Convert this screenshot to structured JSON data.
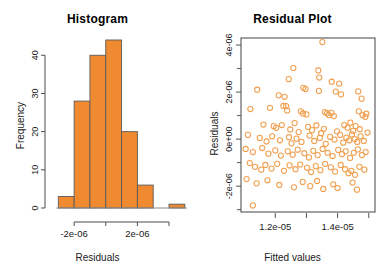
{
  "figure": {
    "background": "#ffffff",
    "panels": [
      "Histogram",
      "Residual Plot"
    ]
  },
  "colors": {
    "bar_fill": "#F08A30",
    "bar_border": "#5a5a5a",
    "point_stroke": "#F0A050",
    "axis": "#4d4d4d",
    "text": "#1a1a1a"
  },
  "histogram": {
    "title": "Histogram",
    "xlabel": "Residuals",
    "ylabel": "Frequency",
    "x_tick_labels": [
      "-2e-06",
      "2e-06"
    ],
    "y_tick_labels": [
      "0",
      "10",
      "20",
      "30",
      "40"
    ]
  },
  "residual": {
    "title": "Residual Plot",
    "xlabel": "Fitted values",
    "ylabel": "Residuals",
    "x_tick_labels": [
      "1.2e-05",
      "1.4e-05"
    ],
    "y_tick_labels": [
      "4e-06",
      "2e-06",
      "0e+00",
      "-2e-06"
    ]
  },
  "chart_data": [
    {
      "type": "bar",
      "title": "Histogram",
      "xlabel": "Residuals",
      "ylabel": "Frequency",
      "grid": false,
      "legend": "none",
      "bin_edges": [
        -3e-06,
        -2e-06,
        -1e-06,
        0,
        1e-06,
        2e-06,
        3e-06,
        4e-06,
        5e-06
      ],
      "categories": [
        "-3e-06..-2e-06",
        "-2e-06..-1e-06",
        "-1e-06..0",
        "0..1e-06",
        "1e-06..2e-06",
        "2e-06..3e-06",
        "4e-06..5e-06"
      ],
      "values": [
        3,
        28,
        40,
        44,
        20,
        6,
        1
      ],
      "xlim": [
        -3.4e-06,
        5.2e-06
      ],
      "ylim": [
        0,
        44
      ],
      "x_ticks": [
        -2e-06,
        0,
        2e-06,
        4e-06
      ],
      "x_ticks_labeled": [
        -2e-06,
        2e-06
      ],
      "y_ticks": [
        0,
        10,
        20,
        30,
        40
      ],
      "note": "Seventh bar is detached with a gap from the main group (outlier bin)."
    },
    {
      "type": "scatter",
      "title": "Residual Plot",
      "xlabel": "Fitted values",
      "ylabel": "Residuals",
      "grid": false,
      "legend": "none",
      "xlim": [
        1.09e-05,
        1.52e-05
      ],
      "ylim": [
        -3.1e-06,
        4.3e-06
      ],
      "x_ticks": [
        1.2e-05,
        1.3e-05,
        1.4e-05,
        1.5e-05
      ],
      "x_ticks_labeled": [
        1.2e-05,
        1.4e-05
      ],
      "y_ticks": [
        -3e-06,
        -2e-06,
        -1e-06,
        0,
        1e-06,
        2e-06,
        3e-06,
        4e-06
      ],
      "y_ticks_labeled": [
        -2e-06,
        0,
        2e-06,
        4e-06
      ],
      "marker": "open-circle",
      "n_points": 142,
      "points": [
        [
          1.351e-05,
          4.13e-06
        ],
        [
          1.258e-05,
          3.02e-06
        ],
        [
          1.338e-05,
          2.92e-06
        ],
        [
          1.243e-05,
          2.55e-06
        ],
        [
          1.341e-05,
          2.62e-06
        ],
        [
          1.381e-05,
          2.44e-06
        ],
        [
          1.405e-05,
          2.36e-06
        ],
        [
          1.142e-05,
          2.1e-06
        ],
        [
          1.29e-05,
          2.18e-06
        ],
        [
          1.297e-05,
          2.13e-06
        ],
        [
          1.34e-05,
          2.05e-06
        ],
        [
          1.394e-05,
          2.02e-06
        ],
        [
          1.411e-05,
          1.9e-06
        ],
        [
          1.211e-05,
          1.86e-06
        ],
        [
          1.23e-05,
          1.8e-06
        ],
        [
          1.466e-05,
          2.03e-06
        ],
        [
          1.477e-05,
          1.72e-06
        ],
        [
          1.12e-05,
          1.28e-06
        ],
        [
          1.183e-05,
          1.33e-06
        ],
        [
          1.226e-05,
          1.41e-06
        ],
        [
          1.235e-05,
          1.4e-06
        ],
        [
          1.238e-05,
          1.22e-06
        ],
        [
          1.282e-05,
          1.18e-06
        ],
        [
          1.289e-05,
          1.09e-06
        ],
        [
          1.3e-05,
          1.05e-06
        ],
        [
          1.359e-05,
          1.15e-06
        ],
        [
          1.366e-05,
          1.1e-06
        ],
        [
          1.372e-05,
          1.02e-06
        ],
        [
          1.38e-05,
          1.12e-06
        ],
        [
          1.388e-05,
          9.8e-07
        ],
        [
          1.468e-05,
          1.18e-06
        ],
        [
          1.48e-05,
          1.02e-06
        ],
        [
          1.489e-05,
          9.5e-07
        ],
        [
          1.492e-05,
          1.08e-06
        ],
        [
          1.162e-05,
          6.2e-07
        ],
        [
          1.195e-05,
          5.5e-07
        ],
        [
          1.203e-05,
          4.8e-07
        ],
        [
          1.221e-05,
          6e-07
        ],
        [
          1.248e-05,
          4.1e-07
        ],
        [
          1.262e-05,
          6.8e-07
        ],
        [
          1.275e-05,
          3e-07
        ],
        [
          1.305e-05,
          5.2e-07
        ],
        [
          1.318e-05,
          3.8e-07
        ],
        [
          1.332e-05,
          5.8e-07
        ],
        [
          1.347e-05,
          2.5e-07
        ],
        [
          1.356e-05,
          4.4e-07
        ],
        [
          1.398e-05,
          3.3e-07
        ],
        [
          1.421e-05,
          6e-07
        ],
        [
          1.432e-05,
          4.8e-07
        ],
        [
          1.441e-05,
          7e-07
        ],
        [
          1.45e-05,
          3.5e-07
        ],
        [
          1.458e-05,
          5.5e-07
        ],
        [
          1.471e-05,
          4.2e-07
        ],
        [
          1.496e-05,
          2.8e-07
        ],
        [
          1.112e-05,
          1.8e-07
        ],
        [
          1.15e-05,
          5e-08
        ],
        [
          1.172e-05,
          -1e-07
        ],
        [
          1.19e-05,
          1.2e-07
        ],
        [
          1.215e-05,
          -5e-08
        ],
        [
          1.244e-05,
          8e-08
        ],
        [
          1.252e-05,
          -1.8e-07
        ],
        [
          1.268e-05,
          2e-08
        ],
        [
          1.284e-05,
          -1.2e-07
        ],
        [
          1.31e-05,
          1.5e-07
        ],
        [
          1.325e-05,
          -8e-08
        ],
        [
          1.343e-05,
          5e-08
        ],
        [
          1.362e-05,
          -2e-07
        ],
        [
          1.376e-05,
          1e-07
        ],
        [
          1.39e-05,
          -2e-08
        ],
        [
          1.408e-05,
          1.8e-07
        ],
        [
          1.418e-05,
          -1.5e-07
        ],
        [
          1.428e-05,
          6e-08
        ],
        [
          1.437e-05,
          -5e-08
        ],
        [
          1.446e-05,
          2e-07
        ],
        [
          1.455e-05,
          0.0
        ],
        [
          1.463e-05,
          -1.2e-07
        ],
        [
          1.474e-05,
          1.2e-07
        ],
        [
          1.484e-05,
          -8e-08
        ],
        [
          1.105e-05,
          -4.2e-07
        ],
        [
          1.128e-05,
          -5.5e-07
        ],
        [
          1.158e-05,
          -3.8e-07
        ],
        [
          1.178e-05,
          -6.2e-07
        ],
        [
          1.2e-05,
          -4.8e-07
        ],
        [
          1.218e-05,
          -7e-07
        ],
        [
          1.24e-05,
          -5.2e-07
        ],
        [
          1.256e-05,
          -6.6e-07
        ],
        [
          1.272e-05,
          -4.5e-07
        ],
        [
          1.293e-05,
          -6e-07
        ],
        [
          1.308e-05,
          -7.8e-07
        ],
        [
          1.322e-05,
          -5e-07
        ],
        [
          1.336e-05,
          -6.8e-07
        ],
        [
          1.352e-05,
          -4.2e-07
        ],
        [
          1.368e-05,
          -5.8e-07
        ],
        [
          1.384e-05,
          -7.2e-07
        ],
        [
          1.402e-05,
          -4.6e-07
        ],
        [
          1.414e-05,
          -6.4e-07
        ],
        [
          1.426e-05,
          -5.2e-07
        ],
        [
          1.44e-05,
          -8e-07
        ],
        [
          1.452e-05,
          -5.8e-07
        ],
        [
          1.465e-05,
          -4.4e-07
        ],
        [
          1.478e-05,
          -6.8e-07
        ],
        [
          1.49e-05,
          -5.5e-07
        ],
        [
          1.118e-05,
          -1.02e-06
        ],
        [
          1.135e-05,
          -1.18e-06
        ],
        [
          1.155e-05,
          -1.3e-06
        ],
        [
          1.168e-05,
          -1.1e-06
        ],
        [
          1.188e-05,
          -1.25e-06
        ],
        [
          1.206e-05,
          -1.05e-06
        ],
        [
          1.228e-05,
          -1.35e-06
        ],
        [
          1.246e-05,
          -1.12e-06
        ],
        [
          1.265e-05,
          -1.28e-06
        ],
        [
          1.28e-05,
          -1.08e-06
        ],
        [
          1.302e-05,
          -1.22e-06
        ],
        [
          1.315e-05,
          -1.4e-06
        ],
        [
          1.33e-05,
          -1.15e-06
        ],
        [
          1.345e-05,
          -1.32e-06
        ],
        [
          1.36e-05,
          -1.05e-06
        ],
        [
          1.378e-05,
          -1.2e-06
        ],
        [
          1.392e-05,
          -1.38e-06
        ],
        [
          1.41e-05,
          -1.1e-06
        ],
        [
          1.424e-05,
          -1.28e-06
        ],
        [
          1.435e-05,
          -1.45e-06
        ],
        [
          1.444e-05,
          -1.35e-06
        ],
        [
          1.456e-05,
          -1.52e-06
        ],
        [
          1.47e-05,
          -1.18e-06
        ],
        [
          1.486e-05,
          -1.3e-06
        ],
        [
          1.108e-05,
          -1.7e-06
        ],
        [
          1.14e-05,
          -1.88e-06
        ],
        [
          1.175e-05,
          -1.75e-06
        ],
        [
          1.213e-05,
          -1.95e-06
        ],
        [
          1.26e-05,
          -2.05e-06
        ],
        [
          1.288e-05,
          -1.82e-06
        ],
        [
          1.312e-05,
          -2e-06
        ],
        [
          1.334e-05,
          -1.78e-06
        ],
        [
          1.354e-05,
          -2.12e-06
        ],
        [
          1.386e-05,
          -1.92e-06
        ],
        [
          1.4e-05,
          -2.08e-06
        ],
        [
          1.448e-05,
          -1.85e-06
        ],
        [
          1.462e-05,
          -2.15e-06
        ],
        [
          1.128e-05,
          -2.82e-06
        ]
      ]
    }
  ]
}
